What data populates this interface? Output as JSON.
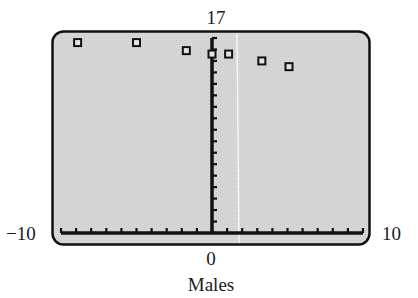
{
  "chart_data": {
    "type": "scatter",
    "title": "",
    "xlabel": "Males",
    "ylabel": "",
    "xlim": [
      -10,
      10
    ],
    "ylim": [
      0,
      17
    ],
    "x_tick_step": 1,
    "y_tick_step": 1,
    "grid": false,
    "legend": null,
    "axis_labels": {
      "ymax": "17",
      "xmin": "−10",
      "xmax": "10",
      "xorigin": "0"
    },
    "series": [
      {
        "name": "Males",
        "marker": "open-square",
        "points": [
          {
            "x": -8.9,
            "y": 16.6
          },
          {
            "x": -5.0,
            "y": 16.6
          },
          {
            "x": -1.7,
            "y": 15.9
          },
          {
            "x": 0.0,
            "y": 15.6
          },
          {
            "x": 1.1,
            "y": 15.6
          },
          {
            "x": 3.3,
            "y": 15.0
          },
          {
            "x": 5.1,
            "y": 14.5
          }
        ]
      }
    ]
  },
  "style": {
    "screen_bg": "#d4d4d4",
    "ink": "#111111",
    "page_bg": "#ffffff"
  }
}
